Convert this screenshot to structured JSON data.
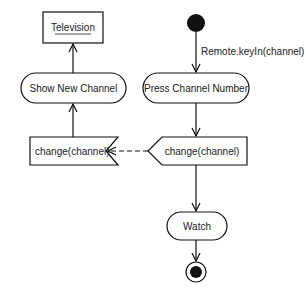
{
  "diagram": {
    "type": "uml-activity",
    "nodes": {
      "object": {
        "label": "Television",
        "kind": "object-node"
      },
      "show": {
        "label": "Show New Channel",
        "kind": "action"
      },
      "accept": {
        "label": "change(channel)",
        "kind": "accept-event"
      },
      "initial": {
        "kind": "initial-node"
      },
      "press": {
        "label": "Press Channel Number",
        "kind": "action"
      },
      "send": {
        "label": "change(channel)",
        "kind": "send-signal"
      },
      "watch": {
        "label": "Watch",
        "kind": "action"
      },
      "final": {
        "kind": "final-node"
      }
    },
    "edges": [
      {
        "from": "initial",
        "to": "press",
        "label": "Remote.keyIn(channel)"
      },
      {
        "from": "press",
        "to": "send",
        "label": ""
      },
      {
        "from": "send",
        "to": "accept",
        "label": "",
        "style": "dashed"
      },
      {
        "from": "send",
        "to": "watch",
        "label": ""
      },
      {
        "from": "watch",
        "to": "final",
        "label": ""
      },
      {
        "from": "accept",
        "to": "show",
        "label": ""
      },
      {
        "from": "show",
        "to": "object",
        "label": ""
      }
    ]
  }
}
